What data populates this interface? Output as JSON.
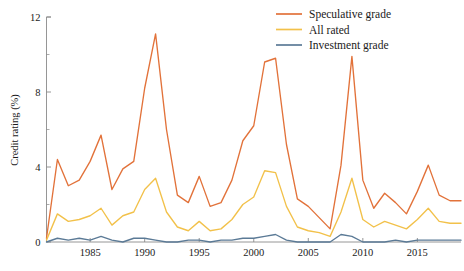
{
  "chart_data": {
    "type": "line",
    "title": "",
    "xlabel": "",
    "ylabel": "Credit rating (%)",
    "xlim": [
      1981,
      2019
    ],
    "ylim": [
      0,
      12
    ],
    "yticks": [
      0,
      4,
      8,
      12
    ],
    "ytick_labels": [
      "0",
      "4",
      "8",
      "12"
    ],
    "yminor_ticks": [
      2,
      6,
      10
    ],
    "xticks": [
      1985,
      1990,
      1995,
      2000,
      2005,
      2010,
      2015
    ],
    "xtick_labels": [
      "1985",
      "1990",
      "1995",
      "2000",
      "2005",
      "2010",
      "2015"
    ],
    "grid": false,
    "legend_position": "top-right",
    "x": [
      1981,
      1982,
      1983,
      1984,
      1985,
      1986,
      1987,
      1988,
      1989,
      1990,
      1991,
      1992,
      1993,
      1994,
      1995,
      1996,
      1997,
      1998,
      1999,
      2000,
      2001,
      2002,
      2003,
      2004,
      2005,
      2006,
      2007,
      2008,
      2009,
      2010,
      2011,
      2012,
      2013,
      2014,
      2015,
      2016,
      2017,
      2018,
      2019
    ],
    "series": [
      {
        "name": "Speculative grade",
        "color": "#E2723A",
        "values": [
          0.2,
          4.4,
          3.0,
          3.3,
          4.3,
          5.7,
          2.8,
          3.9,
          4.3,
          8.2,
          11.1,
          6.0,
          2.5,
          2.1,
          3.5,
          1.9,
          2.1,
          3.3,
          5.4,
          6.2,
          9.6,
          9.8,
          5.2,
          2.3,
          1.9,
          1.3,
          0.7,
          4.1,
          9.9,
          3.3,
          1.8,
          2.6,
          2.1,
          1.5,
          2.7,
          4.1,
          2.5,
          2.2,
          2.2
        ]
      },
      {
        "name": "All rated",
        "color": "#F2C14A",
        "values": [
          0.1,
          1.5,
          1.1,
          1.2,
          1.4,
          1.8,
          0.9,
          1.4,
          1.6,
          2.8,
          3.4,
          1.6,
          0.8,
          0.6,
          1.1,
          0.6,
          0.7,
          1.2,
          2.0,
          2.4,
          3.8,
          3.7,
          1.9,
          0.8,
          0.6,
          0.5,
          0.3,
          1.6,
          3.4,
          1.2,
          0.8,
          1.1,
          0.9,
          0.7,
          1.2,
          1.8,
          1.1,
          1.0,
          1.0
        ]
      },
      {
        "name": "Investment grade",
        "color": "#5B7A96",
        "values": [
          0.0,
          0.2,
          0.1,
          0.2,
          0.1,
          0.3,
          0.1,
          0.0,
          0.2,
          0.2,
          0.1,
          0.0,
          0.0,
          0.1,
          0.1,
          0.0,
          0.1,
          0.1,
          0.2,
          0.2,
          0.3,
          0.4,
          0.1,
          0.0,
          0.0,
          0.0,
          0.0,
          0.4,
          0.3,
          0.0,
          0.0,
          0.0,
          0.1,
          0.0,
          0.1,
          0.1,
          0.1,
          0.1,
          0.1
        ]
      }
    ]
  },
  "legend": {
    "items": [
      {
        "label": "Speculative grade",
        "color": "#E2723A"
      },
      {
        "label": "All rated",
        "color": "#F2C14A"
      },
      {
        "label": "Investment grade",
        "color": "#5B7A96"
      }
    ]
  },
  "axes": {
    "y_axis_title": "Credit rating (%)"
  }
}
